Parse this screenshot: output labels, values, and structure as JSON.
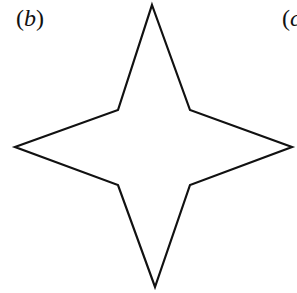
{
  "labels": {
    "b": {
      "open": "(",
      "letter": "b",
      "close": ")"
    },
    "c": {
      "open": "(",
      "letter": "c"
    }
  },
  "shape": {
    "type": "four-pointed star",
    "stroke_color": "#111111",
    "fill_color": "#ffffff",
    "stroke_width": 2.2,
    "points": "152,5 190,110 292,147 190,185 155,287 118,185 15,147 118,110"
  }
}
